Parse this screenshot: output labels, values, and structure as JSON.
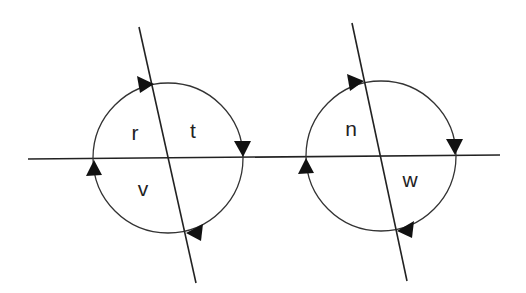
{
  "diagram": {
    "colors": {
      "background": "#ffffff",
      "stroke": "#222222",
      "arrow": "#111111"
    },
    "horizontal_line": {
      "x1": 28,
      "y1": 159,
      "x2": 500,
      "y2": 155
    },
    "figures": [
      {
        "name": "left",
        "circle": {
          "cx": 168,
          "cy": 158,
          "r": 75
        },
        "slanted_line": {
          "x1": 139,
          "y1": 27,
          "x2": 196,
          "y2": 283
        },
        "direction": "clockwise",
        "labels": [
          {
            "text": "r",
            "x": 135,
            "y": 133
          },
          {
            "text": "t",
            "x": 193,
            "y": 131
          },
          {
            "text": "v",
            "x": 143,
            "y": 190
          }
        ]
      },
      {
        "name": "right",
        "circle": {
          "cx": 381,
          "cy": 156,
          "r": 75
        },
        "slanted_line": {
          "x1": 352,
          "y1": 23,
          "x2": 407,
          "y2": 281
        },
        "direction": "clockwise",
        "labels": [
          {
            "text": "n",
            "x": 351,
            "y": 129
          },
          {
            "text": "w",
            "x": 410,
            "y": 181
          }
        ]
      }
    ]
  },
  "labels": {
    "r": "r",
    "t": "t",
    "v": "v",
    "n": "n",
    "w": "w"
  }
}
